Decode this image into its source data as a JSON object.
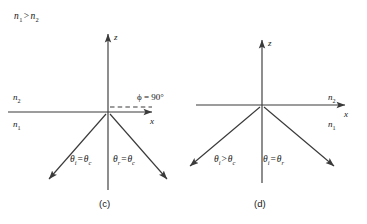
{
  "figure": {
    "condition_title": "n1 > n2",
    "condition_title_parts": {
      "n_first": "n",
      "sub_first": "1",
      "relation": ">",
      "n_second": "n",
      "sub_second": "2"
    },
    "panels": [
      {
        "id": "c",
        "caption": "(c)",
        "description": "Incidence at the critical angle: refracted ray grazes along the interface at 90 degrees",
        "axes": {
          "vertical_label": "z",
          "horizontal_label": "x"
        },
        "media": {
          "upper_label": "n",
          "upper_sub": "2",
          "lower_label": "n",
          "lower_sub": "1"
        },
        "refraction_angle_label": "ϕ = 90°",
        "refraction_angle_value": "90°",
        "refraction_symbol": "ϕ",
        "incident_angle_label": "θi = θc",
        "incident_angle_parts": {
          "theta": "θ",
          "sub_left": "i",
          "relation": "=",
          "theta2": "θ",
          "sub_right": "c"
        },
        "reflected_angle_label": "θr = θc",
        "reflected_angle_parts": {
          "theta": "θ",
          "sub_left": "r",
          "relation": "=",
          "theta2": "θ",
          "sub_right": "c"
        }
      },
      {
        "id": "d",
        "caption": "(d)",
        "description": "Incidence beyond the critical angle: total internal reflection, no refracted ray",
        "axes": {
          "vertical_label": "z",
          "horizontal_label": "x"
        },
        "media": {
          "upper_label": "n",
          "upper_sub": "2",
          "lower_label": "n",
          "lower_sub": "1"
        },
        "incident_angle_label": "θi > θc",
        "incident_angle_parts": {
          "theta": "θ",
          "sub_left": "i",
          "relation": ">",
          "theta2": "θ",
          "sub_right": "c"
        },
        "reflected_angle_label": "θi = θr",
        "reflected_angle_parts": {
          "theta": "θ",
          "sub_left": "i",
          "relation": "=",
          "theta2": "θ",
          "sub_right": "r"
        }
      }
    ],
    "colors": {
      "ink": "#161616",
      "line": "#3a3a3a",
      "background": "#ffffff"
    }
  }
}
